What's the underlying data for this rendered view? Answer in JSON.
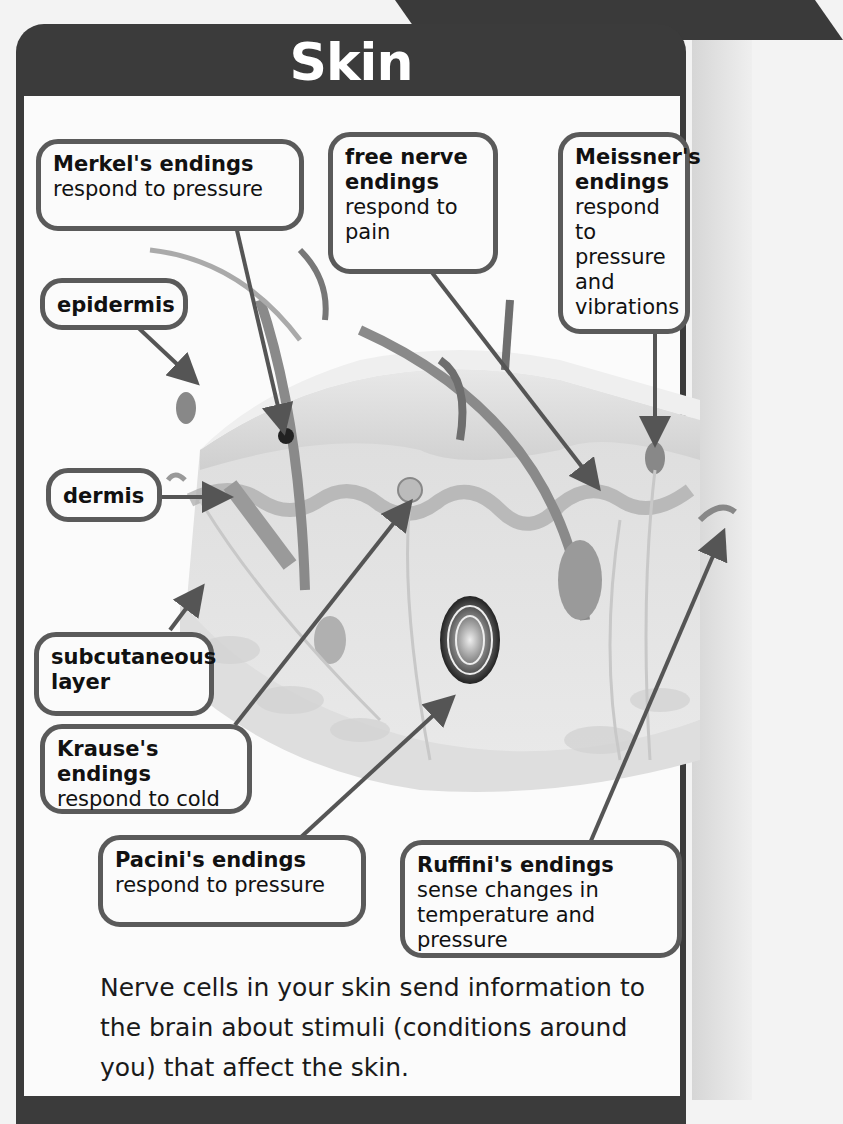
{
  "title": "Skin",
  "callouts": {
    "merkel": {
      "term": "Merkel's endings",
      "desc": "respond to pressure"
    },
    "free_nerve": {
      "term": "free nerve endings",
      "desc": "respond to pain"
    },
    "meissner": {
      "term": "Meissner's endings",
      "desc": "respond to pressure and vibrations"
    },
    "epidermis": {
      "term": "epidermis"
    },
    "dermis": {
      "term": "dermis"
    },
    "subcutaneous": {
      "term": "subcutaneous layer"
    },
    "krause": {
      "term": "Krause's endings",
      "desc": "respond to cold"
    },
    "pacini": {
      "term": "Pacini's endings",
      "desc": "respond to pressure"
    },
    "ruffini": {
      "term": "Ruffini's endings",
      "desc": "sense changes in temperature and pressure"
    }
  },
  "caption": "Nerve cells in your skin send information to the brain about stimuli (conditions around you) that affect the skin.",
  "colors": {
    "frame": "#3b3b3b",
    "callout_border": "#5a5a5a",
    "arrow": "#555555",
    "panel": "#fbfbfb"
  }
}
